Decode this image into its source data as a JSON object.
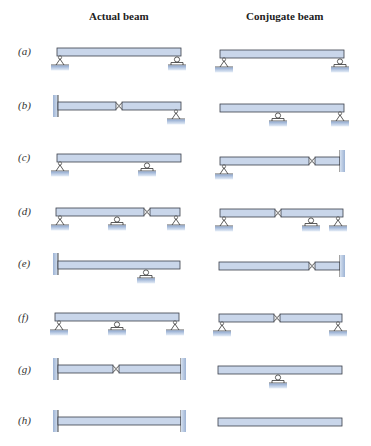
{
  "headers": {
    "actual": "Actual beam",
    "conjugate": "Conjugate beam"
  },
  "colors": {
    "beam_fill": "#c9d6ea",
    "beam_stroke": "#3a3f4a",
    "ground": "#9fb5d6",
    "wall": "#a9bcd8"
  },
  "rows": [
    {
      "label": "(a)",
      "actual": "pin (left) + roller (right)",
      "conjugate": "pin (left) + roller (right)"
    },
    {
      "label": "(b)",
      "actual": "fixed (left) + hinge + pin (right)",
      "conjugate": "free (left) + roller (interior) + pin (right)"
    },
    {
      "label": "(c)",
      "actual": "pin (left) + roller (interior), overhang right",
      "conjugate": "pin (left) + hinge + fixed (right)"
    },
    {
      "label": "(d)",
      "actual": "pin (left) + roller (interior) + hinge + pin (right)",
      "conjugate": "pin (left) + hinge + roller (interior) + pin (right)"
    },
    {
      "label": "(e)",
      "actual": "fixed (left) + roller (interior), overhang right",
      "conjugate": "free (left) + hinge + fixed (right)"
    },
    {
      "label": "(f)",
      "actual": "pin (left) + roller (middle) + pin (right)",
      "conjugate": "pin (left) + hinge (middle) + pin (right)"
    },
    {
      "label": "(g)",
      "actual": "fixed (left) + hinge + fixed (right)",
      "conjugate": "free ends + roller (middle)"
    },
    {
      "label": "(h)",
      "actual": "fixed (left) + fixed (right)",
      "conjugate": "free (left) + free (right)"
    }
  ]
}
